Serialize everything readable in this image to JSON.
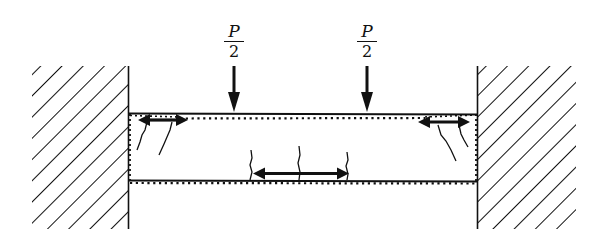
{
  "diagram": {
    "loads": [
      {
        "label_numerator": "P",
        "label_denominator": "2",
        "x": 233,
        "direction": "down"
      },
      {
        "label_numerator": "P",
        "label_denominator": "2",
        "x": 366,
        "direction": "down"
      }
    ],
    "supports": [
      {
        "side": "left",
        "type": "fixed-wall-hatched"
      },
      {
        "side": "right",
        "type": "fixed-wall-hatched"
      }
    ],
    "reinforcement": [
      {
        "location": "top",
        "style": "dotted"
      },
      {
        "location": "bottom",
        "style": "dotted"
      }
    ],
    "force_arrows": [
      {
        "location": "top-left support",
        "type": "double-headed"
      },
      {
        "location": "top-right support",
        "type": "double-headed"
      },
      {
        "location": "bottom midspan",
        "type": "double-headed"
      }
    ],
    "cracks": [
      {
        "location": "top-left near support",
        "count": 2
      },
      {
        "location": "top-right near support",
        "count": 2
      },
      {
        "location": "bottom midspan",
        "count": 3
      }
    ],
    "colors": {
      "ink": "#111111",
      "background": "#ffffff"
    }
  }
}
